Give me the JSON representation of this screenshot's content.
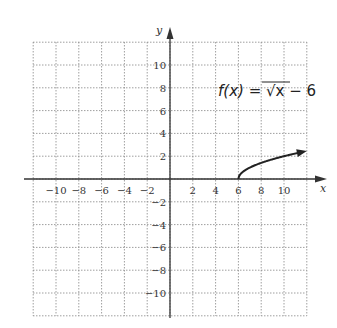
{
  "chart_data": {
    "type": "line",
    "title": "",
    "function_label": "f(x) = √x − 6",
    "function_label_parts": {
      "lhs": "f(x) = ",
      "radical": "√",
      "radicand": "x − 6"
    },
    "xlabel": "x",
    "ylabel": "y",
    "xlim": [
      -12,
      12
    ],
    "ylim": [
      -12,
      12
    ],
    "grid": true,
    "grid_style": "dotted",
    "x_ticks": [
      -10,
      -8,
      -6,
      -4,
      -2,
      2,
      4,
      6,
      8,
      10
    ],
    "y_ticks": [
      10,
      8,
      6,
      4,
      2,
      -2,
      -4,
      -6,
      -8,
      -10
    ],
    "x_tick_labels": [
      "−10",
      "−8",
      "−6",
      "−4",
      "−2",
      "2",
      "4",
      "6",
      "8",
      "10"
    ],
    "y_tick_labels": [
      "10",
      "8",
      "6",
      "4",
      "2",
      "−2",
      "−4",
      "−6",
      "−8",
      "−10"
    ],
    "series": [
      {
        "name": "f(x) = sqrt(x - 6)",
        "x": [
          6,
          6.25,
          7,
          8,
          9,
          10,
          11,
          12
        ],
        "y": [
          0,
          0.5,
          1,
          1.41,
          1.73,
          2,
          2.24,
          2.45
        ],
        "end_arrow": true
      }
    ]
  },
  "colors": {
    "axis": "#333333",
    "grid": "#888888",
    "curve": "#222222"
  }
}
